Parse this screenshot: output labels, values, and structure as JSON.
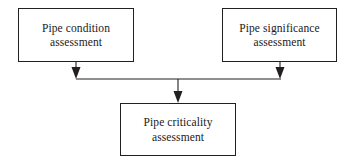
{
  "diagram": {
    "type": "flowchart",
    "background_color": "#ffffff",
    "line_color": "#231f20",
    "text_color": "#1a1a1a",
    "nodes": [
      {
        "id": "condition",
        "label": "Pipe condition\nassessment",
        "shape": "rectangle",
        "position": "top-left"
      },
      {
        "id": "significance",
        "label": "Pipe significance\nassessment",
        "shape": "rectangle",
        "position": "top-right"
      },
      {
        "id": "criticality",
        "label": "Pipe criticality\nassessment",
        "shape": "rectangle",
        "position": "bottom-center"
      }
    ],
    "edges": [
      {
        "id": "condition-to-junction",
        "from": "condition",
        "to": "junction",
        "arrowhead": "filled-triangle-down"
      },
      {
        "id": "significance-to-junction",
        "from": "significance",
        "to": "junction",
        "arrowhead": "filled-triangle-down"
      },
      {
        "id": "junction-to-criticality",
        "from": "junction",
        "to": "criticality",
        "arrowhead": "filled-triangle-down"
      }
    ]
  }
}
